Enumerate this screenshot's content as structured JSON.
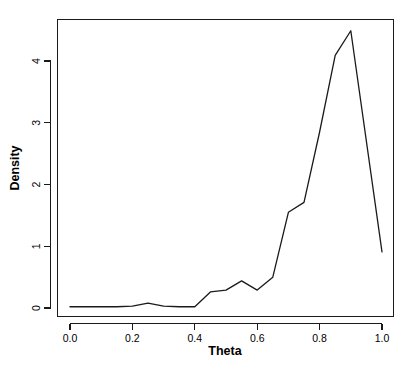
{
  "chart_data": {
    "type": "line",
    "title": "",
    "subtitle": "",
    "xlabel": "Theta",
    "ylabel": "Density",
    "xlim": [
      0.0,
      1.0
    ],
    "ylim": [
      0.0,
      4.55
    ],
    "grid": false,
    "legend": null,
    "legend_position": "none",
    "line_color": "#1a1a1a",
    "background_color": "#ffffff",
    "xticks": [
      0.0,
      0.2,
      0.4,
      0.6,
      0.8,
      1.0
    ],
    "xtick_labels": [
      "0.0",
      "0.2",
      "0.4",
      "0.6",
      "0.8",
      "1.0"
    ],
    "yticks": [
      0,
      1,
      2,
      3,
      4
    ],
    "ytick_labels": [
      "0",
      "1",
      "2",
      "3",
      "4"
    ],
    "x": [
      0.0,
      0.05,
      0.1,
      0.15,
      0.2,
      0.25,
      0.3,
      0.35,
      0.4,
      0.45,
      0.5,
      0.55,
      0.6,
      0.65,
      0.7,
      0.75,
      0.8,
      0.85,
      0.9,
      1.0
    ],
    "values": [
      0.02,
      0.02,
      0.02,
      0.02,
      0.03,
      0.08,
      0.03,
      0.02,
      0.02,
      0.26,
      0.29,
      0.44,
      0.29,
      0.5,
      1.55,
      1.71,
      2.85,
      4.09,
      4.49,
      0.91
    ],
    "series": [
      {
        "name": "Density",
        "x": [
          0.0,
          0.05,
          0.1,
          0.15,
          0.2,
          0.25,
          0.3,
          0.35,
          0.4,
          0.45,
          0.5,
          0.55,
          0.6,
          0.65,
          0.7,
          0.75,
          0.8,
          0.85,
          0.9,
          1.0
        ],
        "values": [
          0.02,
          0.02,
          0.02,
          0.02,
          0.03,
          0.08,
          0.03,
          0.02,
          0.02,
          0.26,
          0.29,
          0.44,
          0.29,
          0.5,
          1.55,
          1.71,
          2.85,
          4.09,
          4.49,
          0.91
        ]
      }
    ],
    "annotations": []
  },
  "axes": {
    "x_title": "Theta",
    "y_title": "Density"
  }
}
